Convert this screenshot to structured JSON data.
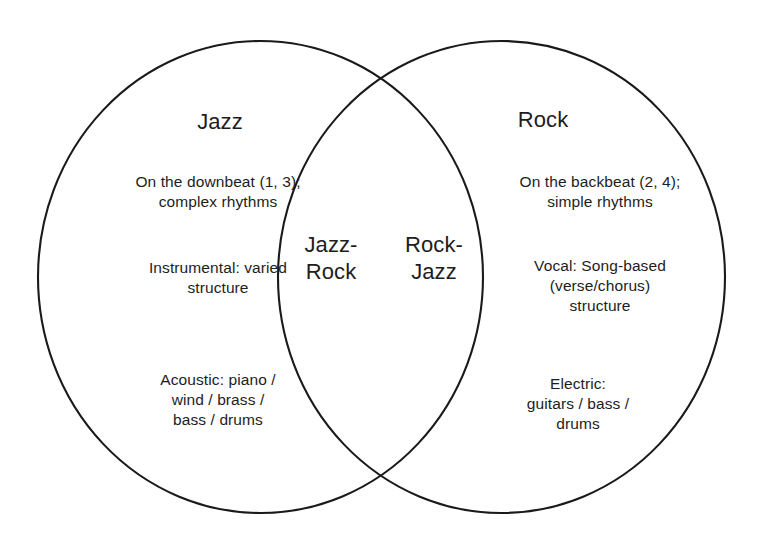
{
  "diagram": {
    "type": "venn",
    "sets": 2,
    "background_color": "#ffffff",
    "stroke_color": "#1a1a1a",
    "text_color": "#1d1d1d",
    "left_set": {
      "name": "Jazz",
      "title": "Jazz",
      "entries": [
        "On the downbeat (1, 3);\ncomplex rhythms",
        "Instrumental: varied\nstructure",
        "Acoustic: piano /\nwind / brass /\nbass / drums"
      ]
    },
    "right_set": {
      "name": "Rock",
      "title": "Rock",
      "entries": [
        "On the backbeat (2, 4);\nsimple rhythms",
        "Vocal: Song-based\n(verse/chorus)\nstructure",
        "Electric:\nguitars / bass /\ndrums"
      ]
    },
    "overlap": {
      "left_label": "Jazz-\nRock",
      "right_label": "Rock-\nJazz"
    }
  }
}
